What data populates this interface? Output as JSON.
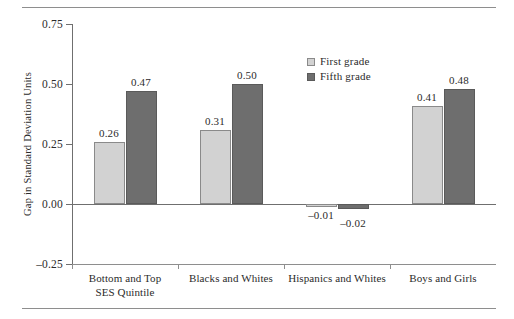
{
  "chart_data": {
    "type": "bar",
    "title": "",
    "subtitle": "",
    "xlabel": "",
    "ylabel": "Gap in Standard Deviation Units",
    "categories": [
      "Bottom and Top\nSES Quintile",
      "Blacks and Whites",
      "Hispanics and Whites",
      "Boys and Girls"
    ],
    "series": [
      {
        "name": "First grade",
        "color": "#d2d2d2",
        "values": [
          0.26,
          0.31,
          -0.01,
          0.41
        ],
        "labels": [
          "0.26",
          "0.31",
          "–0.01",
          "0.41"
        ]
      },
      {
        "name": "Fifth grade",
        "color": "#6e6e6e",
        "values": [
          0.47,
          0.5,
          -0.02,
          0.48
        ],
        "labels": [
          "0.47",
          "0.50",
          "–0.02",
          "0.48"
        ]
      }
    ],
    "ylim": [
      -0.25,
      0.75
    ],
    "yticks": [
      0.75,
      0.5,
      0.25,
      0.0,
      -0.25
    ],
    "ytick_labels": [
      "0.75",
      "0.50",
      "0.25",
      "0.00",
      "–0.25"
    ],
    "grid": false,
    "legend_position": "upper-center-right",
    "orientation": "vertical",
    "grouping": "grouped"
  },
  "legend": {
    "items": [
      {
        "label": "First grade"
      },
      {
        "label": "Fifth grade"
      }
    ]
  },
  "colors": {
    "first_grade": "#d2d2d2",
    "fifth_grade": "#6e6e6e",
    "axis": "#6f6f6f",
    "rule": "#8e8e8e",
    "text": "#2b2b2b"
  }
}
